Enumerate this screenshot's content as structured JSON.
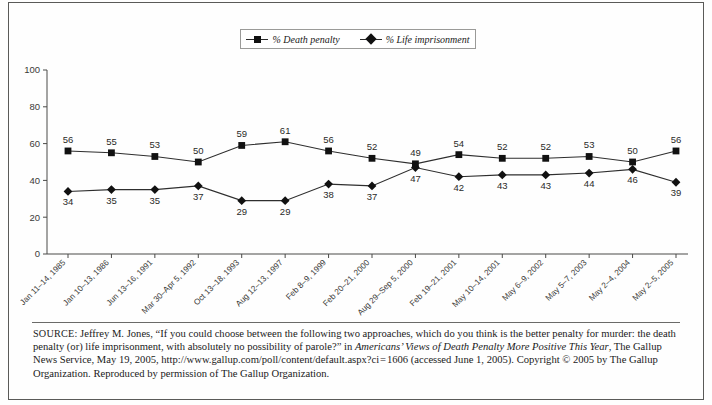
{
  "legend": {
    "position": "top-center",
    "entries": [
      {
        "label": "% Death penalty",
        "marker": "square-marker-icon"
      },
      {
        "label": "% Life imprisonment",
        "marker": "diamond-marker-icon"
      }
    ]
  },
  "chart_data": {
    "type": "line",
    "title": "",
    "xlabel": "",
    "ylabel": "",
    "ylim": [
      0,
      100
    ],
    "yticks": [
      0,
      20,
      40,
      60,
      80,
      100
    ],
    "grid": false,
    "legend_position": "top-center",
    "categories": [
      "Jan 11–14, 1985",
      "Jan 10–13, 1986",
      "Jun 13–16, 1991",
      "Mar 30–Apr 5, 1992",
      "Oct 13–18, 1993",
      "Aug 12–13, 1997",
      "Feb 8–9, 1999",
      "Feb 20–21, 2000",
      "Aug 29–Sep 5, 2000",
      "Feb 19–21, 2001",
      "May 10–14, 2001",
      "May 6–9, 2002",
      "May 5–7, 2003",
      "May 2–4, 2004",
      "May 2–5, 2005"
    ],
    "series": [
      {
        "name": "% Death penalty",
        "marker": "square",
        "values": [
          56,
          55,
          53,
          50,
          59,
          61,
          56,
          52,
          49,
          54,
          52,
          52,
          53,
          50,
          56
        ]
      },
      {
        "name": "% Life imprisonment",
        "marker": "diamond",
        "values": [
          34,
          35,
          35,
          37,
          29,
          29,
          38,
          37,
          47,
          42,
          43,
          43,
          44,
          46,
          39
        ]
      }
    ]
  },
  "source_note": {
    "keyword": "SOURCE:",
    "text_part1": " Jeffrey M. Jones, “If you could choose between the following two approaches, which do you think is the better penalty for murder: the death penalty (or) life imprisonment, with absolutely no possibility of parole?” in ",
    "italic_title": "Americans’ Views of Death Penalty More Positive This Year",
    "text_part2": ", The Gallup News Service, May 19, 2005, http://www.gallup.com/poll/content/default.aspx?ci = 1606  (accessed June 1, 2005). Copyright © 2005 by The Gallup Organization. Reproduced by permission of The Gallup Organization."
  }
}
